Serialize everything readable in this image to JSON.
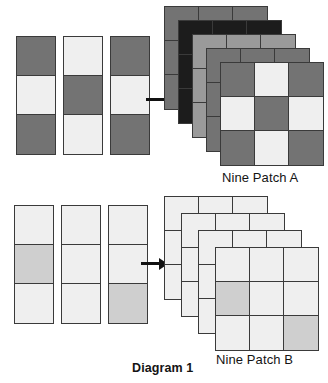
{
  "diagram": {
    "title": "Diagram 1",
    "palette": {
      "dark": "#737373",
      "light": "#efefef",
      "medium": "#cfcfcf",
      "black": "#1c1c1c",
      "mid_dark": "#9a9a9a",
      "outline": "#3a3a3a",
      "arrow": "#111111",
      "background": "#ffffff"
    },
    "arrows": [
      {
        "name": "arrow-to-nine-patch-a",
        "direction": "right"
      },
      {
        "name": "arrow-to-nine-patch-b",
        "direction": "right"
      }
    ],
    "rows": [
      {
        "id": "row-a",
        "caption": "Nine Patch A",
        "strips": [
          {
            "id": "strip-a-1",
            "cells": [
              "dark",
              "light",
              "dark"
            ]
          },
          {
            "id": "strip-a-2",
            "cells": [
              "light",
              "dark",
              "light"
            ]
          },
          {
            "id": "strip-a-3",
            "cells": [
              "dark",
              "light",
              "dark"
            ]
          }
        ],
        "stack": {
          "count": 5,
          "layers": [
            {
              "id": "patch-a-back-5",
              "tone": "dark",
              "offset_x": 0,
              "offset_y": 0
            },
            {
              "id": "patch-a-back-4",
              "tone": "black",
              "offset_x": 14,
              "offset_y": 14
            },
            {
              "id": "patch-a-back-3",
              "tone": "mid_dark",
              "offset_x": 28,
              "offset_y": 28
            },
            {
              "id": "patch-a-back-2",
              "tone": "dark",
              "offset_x": 42,
              "offset_y": 42
            },
            {
              "id": "patch-a-front",
              "tone": "front",
              "offset_x": 56,
              "offset_y": 56,
              "cells": [
                "dark",
                "light",
                "dark",
                "light",
                "dark",
                "light",
                "dark",
                "light",
                "dark"
              ]
            }
          ]
        }
      },
      {
        "id": "row-b",
        "caption": "Nine Patch B",
        "strips": [
          {
            "id": "strip-b-1",
            "cells": [
              "light",
              "medium",
              "light"
            ]
          },
          {
            "id": "strip-b-2",
            "cells": [
              "light",
              "light",
              "light"
            ]
          },
          {
            "id": "strip-b-3",
            "cells": [
              "light",
              "light",
              "medium"
            ]
          }
        ],
        "stack": {
          "count": 4,
          "layers": [
            {
              "id": "patch-b-back-4",
              "tone": "light",
              "offset_x": 0,
              "offset_y": 0
            },
            {
              "id": "patch-b-back-3",
              "tone": "light",
              "offset_x": 17,
              "offset_y": 17
            },
            {
              "id": "patch-b-back-2",
              "tone": "light",
              "offset_x": 34,
              "offset_y": 34
            },
            {
              "id": "patch-b-front",
              "tone": "front",
              "offset_x": 51,
              "offset_y": 51,
              "cells": [
                "light",
                "light",
                "light",
                "medium",
                "light",
                "light",
                "light",
                "light",
                "medium"
              ]
            }
          ]
        }
      }
    ]
  }
}
